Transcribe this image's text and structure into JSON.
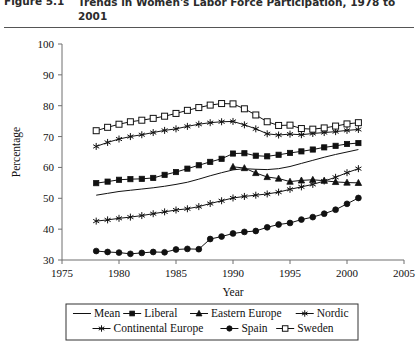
{
  "figure": {
    "label": "Figure 5.1",
    "title": "Trends in Women's Labor Force Participation, 1978 to 2001"
  },
  "chart_data": {
    "type": "line",
    "title": "Trends in Women's Labor Force Participation, 1978 to 2001",
    "xlabel": "Year",
    "ylabel": "Percentage",
    "xlim": [
      1975,
      2005
    ],
    "ylim": [
      30,
      100
    ],
    "xticks": [
      1975,
      1980,
      1985,
      1990,
      1995,
      2000,
      2005
    ],
    "yticks": [
      30,
      40,
      50,
      60,
      70,
      80,
      90,
      100
    ],
    "grid": false,
    "legend_position": "below",
    "series": [
      {
        "name": "Mean",
        "marker": "none",
        "x": [
          1978,
          1979,
          1980,
          1981,
          1982,
          1983,
          1984,
          1985,
          1986,
          1987,
          1988,
          1989,
          1990,
          1991,
          1992,
          1993,
          1994,
          1995,
          1996,
          1997,
          1998,
          1999,
          2000,
          2001
        ],
        "values": [
          51.0,
          51.6,
          52.2,
          52.6,
          53.0,
          53.4,
          53.9,
          54.5,
          55.2,
          56.2,
          57.3,
          58.3,
          59.2,
          59.6,
          59.4,
          59.3,
          59.6,
          60.3,
          61.3,
          62.3,
          63.3,
          64.2,
          65.0,
          65.8
        ]
      },
      {
        "name": "Liberal",
        "marker": "filled-square",
        "x": [
          1978,
          1979,
          1980,
          1981,
          1982,
          1983,
          1984,
          1985,
          1986,
          1987,
          1988,
          1989,
          1990,
          1991,
          1992,
          1993,
          1994,
          1995,
          1996,
          1997,
          1998,
          1999,
          2000,
          2001
        ],
        "values": [
          54.9,
          55.4,
          56.0,
          56.2,
          56.3,
          56.6,
          57.6,
          58.5,
          59.6,
          60.7,
          61.8,
          62.8,
          64.5,
          64.6,
          63.8,
          63.6,
          64.1,
          64.7,
          65.2,
          65.8,
          66.5,
          67.0,
          67.6,
          67.9
        ]
      },
      {
        "name": "Eastern Europe",
        "marker": "filled-triangle",
        "x": [
          1990,
          1991,
          1992,
          1993,
          1994,
          1995,
          1996,
          1997,
          1998,
          1999,
          2000,
          2001
        ],
        "values": [
          60.2,
          59.8,
          58.2,
          56.9,
          56.4,
          55.4,
          55.8,
          56.0,
          55.7,
          55.3,
          55.1,
          55.0
        ]
      },
      {
        "name": "Nordic",
        "marker": "star",
        "x": [
          1978,
          1979,
          1980,
          1981,
          1982,
          1983,
          1984,
          1985,
          1986,
          1987,
          1988,
          1989,
          1990,
          1991,
          1992,
          1993,
          1994,
          1995,
          1996,
          1997,
          1998,
          1999,
          2000,
          2001
        ],
        "values": [
          66.8,
          68.1,
          69.2,
          70.0,
          70.6,
          71.3,
          72.0,
          72.5,
          73.3,
          74.0,
          74.5,
          74.8,
          74.9,
          73.8,
          72.5,
          70.9,
          70.5,
          70.8,
          70.6,
          71.0,
          71.3,
          71.6,
          72.0,
          72.3
        ]
      },
      {
        "name": "Continental Europe",
        "marker": "star",
        "x": [
          1978,
          1979,
          1980,
          1981,
          1982,
          1983,
          1984,
          1985,
          1986,
          1987,
          1988,
          1989,
          1990,
          1991,
          1992,
          1993,
          1994,
          1995,
          1996,
          1997,
          1998,
          1999,
          2000,
          2001
        ],
        "values": [
          42.6,
          43.0,
          43.5,
          43.9,
          44.4,
          45.0,
          45.6,
          46.2,
          46.6,
          47.3,
          48.3,
          49.2,
          50.1,
          50.6,
          51.0,
          51.4,
          52.0,
          52.9,
          53.7,
          54.5,
          55.6,
          56.8,
          58.3,
          59.6
        ]
      },
      {
        "name": "Spain",
        "marker": "filled-circle",
        "x": [
          1978,
          1979,
          1980,
          1981,
          1982,
          1983,
          1984,
          1985,
          1986,
          1987,
          1988,
          1989,
          1990,
          1991,
          1992,
          1993,
          1994,
          1995,
          1996,
          1997,
          1998,
          1999,
          2000,
          2001
        ],
        "values": [
          32.9,
          32.6,
          32.4,
          32.0,
          32.3,
          32.6,
          32.5,
          33.4,
          33.6,
          33.5,
          36.8,
          37.6,
          38.6,
          39.1,
          39.4,
          40.6,
          41.5,
          42.0,
          43.1,
          43.9,
          45.0,
          46.3,
          48.2,
          50.1
        ]
      },
      {
        "name": "Sweden",
        "marker": "open-square",
        "x": [
          1978,
          1979,
          1980,
          1981,
          1982,
          1983,
          1984,
          1985,
          1986,
          1987,
          1988,
          1989,
          1990,
          1991,
          1992,
          1993,
          1994,
          1995,
          1996,
          1997,
          1998,
          1999,
          2000,
          2001
        ],
        "values": [
          71.9,
          73.0,
          74.0,
          74.8,
          75.3,
          75.9,
          76.6,
          77.5,
          78.5,
          79.4,
          80.2,
          80.7,
          80.6,
          79.0,
          77.0,
          74.8,
          73.6,
          73.7,
          72.6,
          72.4,
          72.8,
          73.4,
          74.1,
          74.5
        ]
      }
    ]
  },
  "legend": {
    "rows": [
      [
        "Mean",
        "Liberal",
        "Eastern Europe",
        "Nordic"
      ],
      [
        "Continental Europe",
        "Spain",
        "Sweden"
      ]
    ]
  }
}
